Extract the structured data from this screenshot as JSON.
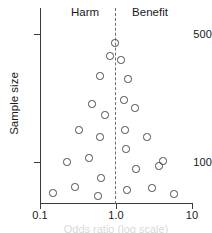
{
  "chart_data": {
    "type": "scatter",
    "title": "",
    "xlabel": "Odds ratio (log scale)",
    "ylabel": "Sample size",
    "xscale": "log",
    "yscale": "log",
    "xlim": [
      0.1,
      10
    ],
    "ylim": [
      50,
      800
    ],
    "grid": false,
    "legend": null,
    "xticks": [
      {
        "value": 0.1,
        "label": "0.1",
        "px": 40
      },
      {
        "value": 1.0,
        "label": "1.0",
        "px": 116
      },
      {
        "value": 10,
        "label": "10",
        "px": 192
      }
    ],
    "yticks": [
      {
        "value": 500,
        "label": "500",
        "px": 34
      },
      {
        "value": 100,
        "label": "100",
        "px": 162
      }
    ],
    "reference_line": {
      "x": 1.0,
      "style": "dashed",
      "label": "null effect"
    },
    "annotations": [
      {
        "text": "Harm",
        "side": "left"
      },
      {
        "text": "Benefit",
        "side": "right"
      }
    ],
    "points": [
      {
        "x": 0.99,
        "y": 470,
        "px": 115,
        "py": 43
      },
      {
        "x": 0.88,
        "y": 380,
        "px": 110,
        "py": 56
      },
      {
        "x": 1.1,
        "y": 355,
        "px": 121,
        "py": 60
      },
      {
        "x": 0.65,
        "y": 285,
        "px": 100,
        "py": 76
      },
      {
        "x": 1.3,
        "y": 272,
        "px": 128,
        "py": 79
      },
      {
        "x": 1.18,
        "y": 228,
        "px": 124,
        "py": 100
      },
      {
        "x": 0.5,
        "y": 215,
        "px": 92,
        "py": 104
      },
      {
        "x": 1.45,
        "y": 210,
        "px": 135,
        "py": 108
      },
      {
        "x": 0.72,
        "y": 195,
        "px": 105,
        "py": 115
      },
      {
        "x": 0.34,
        "y": 165,
        "px": 79,
        "py": 130
      },
      {
        "x": 1.22,
        "y": 165,
        "px": 125,
        "py": 130
      },
      {
        "x": 0.64,
        "y": 152,
        "px": 100,
        "py": 137
      },
      {
        "x": 2.45,
        "y": 152,
        "px": 147,
        "py": 137
      },
      {
        "x": 1.28,
        "y": 128,
        "px": 126,
        "py": 149
      },
      {
        "x": 0.45,
        "y": 112,
        "px": 89,
        "py": 158
      },
      {
        "x": 3.9,
        "y": 105,
        "px": 163,
        "py": 161
      },
      {
        "x": 0.26,
        "y": 102,
        "px": 67,
        "py": 162
      },
      {
        "x": 1.55,
        "y": 93,
        "px": 136,
        "py": 169
      },
      {
        "x": 2.9,
        "y": 97,
        "px": 159,
        "py": 166
      },
      {
        "x": 0.66,
        "y": 82,
        "px": 101,
        "py": 178
      },
      {
        "x": 0.33,
        "y": 70,
        "px": 75,
        "py": 187
      },
      {
        "x": 1.35,
        "y": 67,
        "px": 127,
        "py": 190
      },
      {
        "x": 2.6,
        "y": 68,
        "px": 152,
        "py": 188
      },
      {
        "x": 0.17,
        "y": 62,
        "px": 53,
        "py": 193
      },
      {
        "x": 0.63,
        "y": 60,
        "px": 98,
        "py": 196
      },
      {
        "x": 6.2,
        "y": 60,
        "px": 174,
        "py": 194
      }
    ]
  },
  "figure": {
    "labels": {
      "harm": "Harm",
      "benefit": "Benefit",
      "y_title": "Sample size",
      "x_title": "Odds ratio (log scale)"
    },
    "colors": {
      "axis": "#3a3a3a",
      "marker_stroke": "#4a4a4a",
      "reference_line": "#6e6e6e",
      "text": "#1a1a1a",
      "background": "#ffffff"
    }
  }
}
